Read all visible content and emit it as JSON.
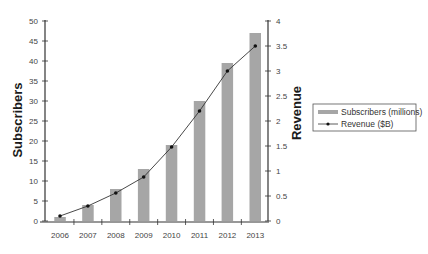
{
  "chart_data": {
    "type": "bar",
    "title": "",
    "xlabel": "",
    "categories": [
      "2006",
      "2007",
      "2008",
      "2009",
      "2010",
      "2011",
      "2012",
      "2013"
    ],
    "series": [
      {
        "name": "Subscribers (millions)",
        "type": "bar",
        "axis": "left",
        "color": "#a6a6a6",
        "values": [
          1,
          4,
          8,
          13,
          19,
          30,
          39.5,
          47
        ]
      },
      {
        "name": "Revenue ($B)",
        "type": "line",
        "axis": "right",
        "color": "#333333",
        "marker": "circle",
        "values": [
          0.1,
          0.3,
          0.56,
          0.88,
          1.48,
          2.2,
          3.0,
          3.5
        ]
      }
    ],
    "left_axis": {
      "label": "Subscribers",
      "ylim": [
        0,
        50
      ],
      "ticks": [
        0,
        5,
        10,
        15,
        20,
        25,
        30,
        35,
        40,
        45,
        50
      ]
    },
    "right_axis": {
      "label": "Revenue",
      "ylim": [
        0,
        4
      ],
      "ticks": [
        "0",
        "0.5",
        "1",
        "1.5",
        "2",
        "2.5",
        "3",
        "3.5",
        "4"
      ]
    },
    "grid": false,
    "legend_position": "right"
  },
  "legend": {
    "items": [
      {
        "label": "Subscribers (millions)",
        "symbol": "bar"
      },
      {
        "label": "Revenue ($B)",
        "symbol": "line-marker"
      }
    ]
  }
}
